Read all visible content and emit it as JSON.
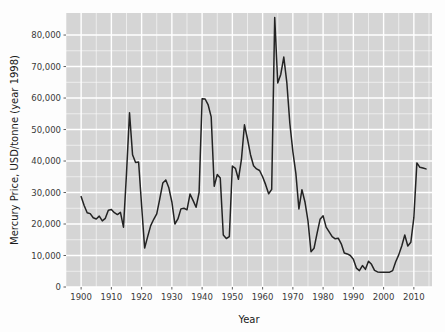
{
  "chart_data": {
    "type": "line",
    "title": "",
    "xlabel": "Year",
    "ylabel": "Mercury Price, USD/tonne (year 1998)",
    "xlim": [
      1895,
      2016
    ],
    "ylim": [
      0,
      87000
    ],
    "grid": true,
    "legend": false,
    "legend_position": "none",
    "x_ticks": [
      1900,
      1910,
      1920,
      1930,
      1940,
      1950,
      1960,
      1970,
      1980,
      1990,
      2000,
      2010
    ],
    "x_tick_labels": [
      "1900",
      "1910",
      "1920",
      "1930",
      "1940",
      "1950",
      "1960",
      "1970",
      "1980",
      "1990",
      "2000",
      "2010"
    ],
    "y_ticks": [
      0,
      10000,
      20000,
      30000,
      40000,
      50000,
      60000,
      70000,
      80000
    ],
    "y_tick_labels": [
      "0",
      "10,000",
      "20,000",
      "30,000",
      "40,000",
      "50,000",
      "60,000",
      "70,000",
      "80,000"
    ],
    "series": [
      {
        "name": "Mercury Price",
        "color": "#232323",
        "x": [
          1900,
          1901,
          1902,
          1903,
          1904,
          1905,
          1906,
          1907,
          1908,
          1909,
          1910,
          1911,
          1912,
          1913,
          1914,
          1915,
          1916,
          1917,
          1918,
          1919,
          1920,
          1921,
          1922,
          1923,
          1924,
          1925,
          1926,
          1927,
          1928,
          1929,
          1930,
          1931,
          1932,
          1933,
          1934,
          1935,
          1936,
          1937,
          1938,
          1939,
          1940,
          1941,
          1942,
          1943,
          1944,
          1945,
          1946,
          1947,
          1948,
          1949,
          1950,
          1951,
          1952,
          1953,
          1954,
          1955,
          1956,
          1957,
          1958,
          1959,
          1960,
          1961,
          1962,
          1963,
          1964,
          1965,
          1966,
          1967,
          1968,
          1969,
          1970,
          1971,
          1972,
          1973,
          1974,
          1975,
          1976,
          1977,
          1978,
          1979,
          1980,
          1981,
          1982,
          1983,
          1984,
          1985,
          1986,
          1987,
          1988,
          1989,
          1990,
          1991,
          1992,
          1993,
          1994,
          1995,
          1996,
          1997,
          1998,
          1999,
          2000,
          2001,
          2002,
          2003,
          2004,
          2005,
          2006,
          2007,
          2008,
          2009,
          2010,
          2011,
          2012,
          2013,
          2014
        ],
        "values": [
          28700,
          25900,
          23600,
          23300,
          22000,
          21600,
          22500,
          21000,
          21800,
          24400,
          24600,
          23600,
          23000,
          23700,
          19000,
          36000,
          55300,
          42000,
          39500,
          39700,
          25800,
          12400,
          16000,
          19500,
          21500,
          23200,
          28000,
          33000,
          34000,
          31500,
          27000,
          20000,
          21600,
          24800,
          25000,
          24500,
          29500,
          27500,
          25300,
          30000,
          59800,
          59700,
          57800,
          54000,
          32000,
          35700,
          34600,
          16500,
          15400,
          16000,
          38400,
          37700,
          34200,
          40500,
          51500,
          47000,
          42000,
          38500,
          37500,
          37000,
          35000,
          32500,
          29600,
          31000,
          85600,
          64800,
          67500,
          73000,
          65000,
          52000,
          43000,
          36000,
          24800,
          30900,
          27000,
          21000,
          11200,
          12300,
          17000,
          21500,
          22600,
          19000,
          17500,
          16000,
          15300,
          15500,
          13700,
          10800,
          10500,
          10000,
          8800,
          6000,
          5200,
          6800,
          5600,
          8200,
          7200,
          5300,
          4800,
          4700,
          4700,
          4700,
          4700,
          5200,
          8000,
          10200,
          13000,
          16500,
          13000,
          14200,
          22000,
          39400,
          38000,
          37800,
          37500
        ]
      }
    ]
  },
  "axes": {
    "panel_background": "#d5d5d5",
    "gridline_color": "#ffffff",
    "outer_background": "#fdfdfd",
    "tick_mark_color": "#4d4d4d",
    "tick_label_color": "#3a3a3a"
  }
}
